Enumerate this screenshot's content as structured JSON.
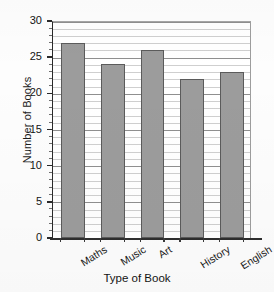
{
  "chart_data": {
    "type": "bar",
    "title": "",
    "categories": [
      "Maths",
      "Music",
      "Art",
      "History",
      "English"
    ],
    "values": [
      27,
      24,
      26,
      22,
      23
    ],
    "xlabel": "Type of Book",
    "ylabel": "Number of Books",
    "ylim": [
      0,
      30
    ],
    "ytick_labels": [
      "0",
      "5",
      "10",
      "15",
      "20",
      "25",
      "30"
    ],
    "ytick_values": [
      0,
      5,
      10,
      15,
      20,
      25,
      30
    ],
    "ytick_minor_step": 1,
    "grid": "horizontal",
    "legend": "none",
    "bar_color": "#9c9c9c",
    "bar_edge_color": "#5b5b5b",
    "gridline_color": "#cfcfcf",
    "axis_color": "#2a2a2a",
    "background_color": "#ffffff"
  }
}
